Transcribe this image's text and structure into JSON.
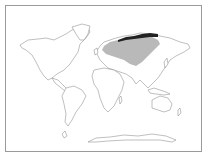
{
  "map": {
    "type": "species-distribution-world-map",
    "projection": "world outline",
    "legend_shown": false,
    "colors": {
      "background": "#ffffff",
      "frame": "#9a9a9a",
      "coastline": "#8a8a8a",
      "land": "#ffffff",
      "range_fill": "#b9b9b9",
      "highlight_fill": "#222222"
    },
    "regions": [
      {
        "name": "range",
        "label": "Northern Eurasia (Europe to Siberia)",
        "style": "gray"
      },
      {
        "name": "highlight",
        "label": "Arctic coast of Siberia",
        "style": "black"
      }
    ]
  }
}
